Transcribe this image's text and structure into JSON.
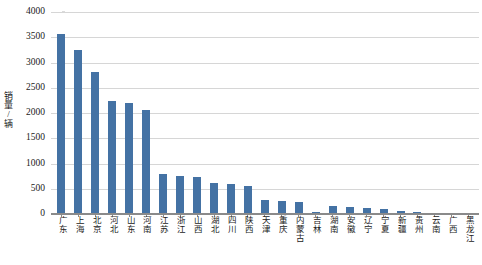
{
  "chart_data": {
    "type": "bar",
    "title": "",
    "xlabel": "",
    "ylabel": "销量/辆",
    "ylim": [
      0,
      4000
    ],
    "ytick_step": 500,
    "yticks": [
      "4000",
      "3500",
      "3000",
      "2500",
      "2000",
      "1500",
      "1000",
      "500",
      "0"
    ],
    "grid": true,
    "legend": false,
    "bar_color": "#4472A4",
    "gridline_color": "#D6D6D6",
    "axis_color": "#8A8A8A",
    "categories": [
      "广东",
      "上海",
      "北京",
      "河北",
      "山东",
      "河南",
      "江苏",
      "浙江",
      "山西",
      "湖北",
      "四川",
      "陕西",
      "天津",
      "重庆",
      "内蒙古",
      "吉林",
      "湖南",
      "安徽",
      "辽宁",
      "宁夏",
      "新疆",
      "贵州",
      "云南",
      "广西",
      "黑龙江"
    ],
    "values": [
      3560,
      3240,
      2810,
      2230,
      2190,
      2060,
      800,
      760,
      740,
      620,
      600,
      560,
      270,
      250,
      240,
      40,
      150,
      130,
      110,
      90,
      50,
      40,
      30,
      25,
      20
    ]
  }
}
